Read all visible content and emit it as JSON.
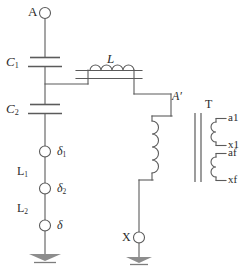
{
  "figure": {
    "type": "electrical-schematic",
    "width": 248,
    "height": 272,
    "background_color": "#ffffff",
    "line_color": "#5b5b5b",
    "text_color": "#2b2b2b"
  },
  "labels": {
    "terminal_a": "A",
    "capacitor_c1": "C",
    "capacitor_c1_sub": "1",
    "capacitor_c2": "C",
    "capacitor_c2_sub": "2",
    "inductor_l": "L",
    "node_a_prime": "A′",
    "transformer_t": "T",
    "arrester_delta1": "δ",
    "arrester_delta1_sub": "1",
    "arrester_delta2": "δ",
    "arrester_delta2_sub": "2",
    "arrester_delta": "δ",
    "reactor_l1": "L",
    "reactor_l1_sub": "1",
    "reactor_l2": "L",
    "reactor_l2_sub": "2",
    "terminal_x": "X",
    "secondary_a1": "a1",
    "secondary_x1": "x1",
    "secondary_af": "af",
    "secondary_xf": "xf"
  },
  "components": [
    {
      "id": "terminal-a",
      "kind": "terminal",
      "label": "A"
    },
    {
      "id": "capacitor-c1",
      "kind": "capacitor",
      "label": "C1"
    },
    {
      "id": "capacitor-c2",
      "kind": "capacitor",
      "label": "C2"
    },
    {
      "id": "inductor-l",
      "kind": "variable-inductor",
      "label": "L",
      "turns": 4
    },
    {
      "id": "node-a-prime",
      "kind": "node",
      "label": "A′"
    },
    {
      "id": "transformer-t",
      "kind": "transformer",
      "label": "T",
      "primary_turns": 4
    },
    {
      "id": "secondary-winding-1",
      "kind": "winding",
      "terminals": [
        "a1",
        "x1"
      ]
    },
    {
      "id": "secondary-winding-2",
      "kind": "winding",
      "terminals": [
        "af",
        "xf"
      ]
    },
    {
      "id": "spark-gap-delta1",
      "kind": "spark-gap",
      "label": "δ1"
    },
    {
      "id": "reactor-l1",
      "kind": "reactor",
      "label": "L1"
    },
    {
      "id": "spark-gap-delta2",
      "kind": "spark-gap",
      "label": "δ2"
    },
    {
      "id": "reactor-l2",
      "kind": "reactor",
      "label": "L2"
    },
    {
      "id": "spark-gap-delta",
      "kind": "spark-gap",
      "label": "δ"
    },
    {
      "id": "ground-left",
      "kind": "ground"
    },
    {
      "id": "terminal-x",
      "kind": "terminal",
      "label": "X"
    },
    {
      "id": "ground-right",
      "kind": "ground"
    }
  ]
}
